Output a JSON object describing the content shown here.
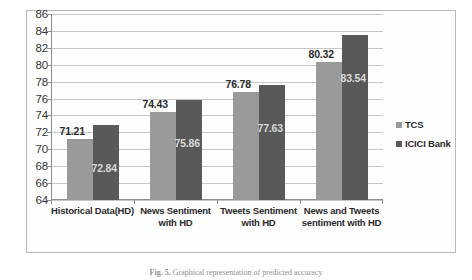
{
  "chart_data": {
    "type": "bar",
    "title": "",
    "xlabel": "",
    "ylabel": "",
    "ylim": [
      64,
      86
    ],
    "ytick_step": 2,
    "yticks": [
      86,
      84,
      82,
      80,
      78,
      76,
      74,
      72,
      70,
      68,
      66,
      64
    ],
    "grid": true,
    "legend_position": "right",
    "categories": [
      "Historical Data(HD)",
      "News Sentiment with HD",
      "Tweets Sentiment with HD",
      "News and Tweets sentiment with HD"
    ],
    "category_lines": [
      [
        "Historical Data(HD)"
      ],
      [
        "News Sentiment",
        "with HD"
      ],
      [
        "Tweets Sentiment",
        "with HD"
      ],
      [
        "News and Tweets",
        "sentiment with HD"
      ]
    ],
    "series": [
      {
        "name": "TCS",
        "color": "#9a9a9a",
        "values": [
          71.21,
          74.43,
          76.78,
          80.32
        ],
        "labels": [
          "71.21",
          "74.43",
          "76.78",
          "80.32"
        ]
      },
      {
        "name": "ICICI Bank",
        "color": "#595959",
        "values": [
          72.84,
          75.86,
          77.63,
          83.54
        ],
        "labels": [
          "72.84",
          "75.86",
          "77.63",
          "83.54"
        ]
      }
    ]
  },
  "legend": {
    "items": [
      {
        "label": "TCS",
        "color": "#9a9a9a"
      },
      {
        "label": "ICICI Bank",
        "color": "#595959"
      }
    ]
  },
  "caption": {
    "prefix": "Fig. 5.",
    "text": "Graphical representation of predicted accuracy"
  }
}
